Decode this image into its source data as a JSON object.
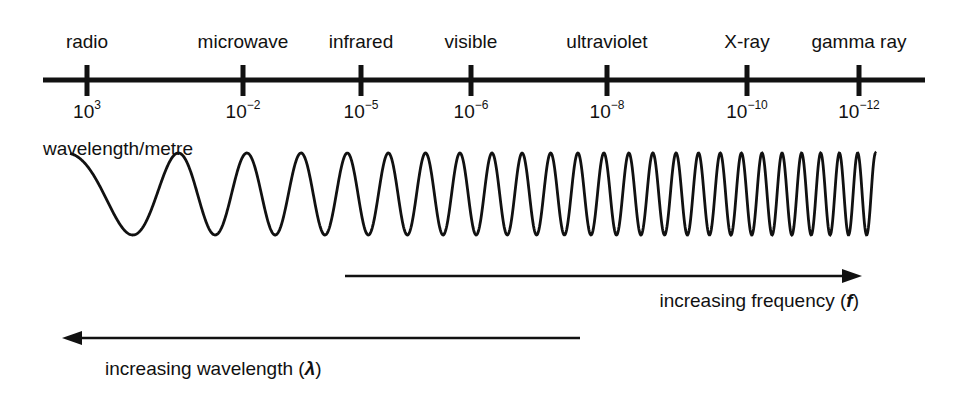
{
  "diagram": {
    "axis_title": "wavelength/metre",
    "bands": [
      {
        "label": "radio",
        "x": 87,
        "exp_base": "10",
        "exp_power": "3"
      },
      {
        "label": "microwave",
        "x": 243,
        "exp_base": "10",
        "exp_power": "−2"
      },
      {
        "label": "infrared",
        "x": 361,
        "exp_base": "10",
        "exp_power": "−5"
      },
      {
        "label": "visible",
        "x": 471,
        "exp_base": "10",
        "exp_power": "−6"
      },
      {
        "label": "ultraviolet",
        "x": 607,
        "exp_base": "10",
        "exp_power": "−8"
      },
      {
        "label": "X-ray",
        "x": 747,
        "exp_base": "10",
        "exp_power": "−10"
      },
      {
        "label": "gamma ray",
        "x": 859,
        "exp_base": "10",
        "exp_power": "−12"
      }
    ],
    "arrows": {
      "frequency": {
        "label_text": "increasing frequency (",
        "symbol": "f",
        "label_end": ")",
        "direction": "right"
      },
      "wavelength": {
        "label_text": "increasing wavelength (",
        "symbol": "λ",
        "label_end": ")",
        "direction": "left"
      }
    },
    "colors": {
      "ink": "#111111",
      "background": "#ffffff"
    },
    "wave": {
      "x_start": 70,
      "x_end": 876,
      "y_center": 194,
      "amplitude": 41,
      "cycles": 25
    }
  },
  "chart_data": {
    "type": "diagram",
    "xlabel": "wavelength/metre",
    "categories": [
      "radio",
      "microwave",
      "infrared",
      "visible",
      "ultraviolet",
      "X-ray",
      "gamma ray"
    ],
    "wavelength_m": [
      "10^3",
      "10^-2",
      "10^-5",
      "10^-6",
      "10^-8",
      "10^-10",
      "10^-12"
    ],
    "annotations": [
      "increasing frequency (f) →",
      "← increasing wavelength (λ)"
    ]
  }
}
